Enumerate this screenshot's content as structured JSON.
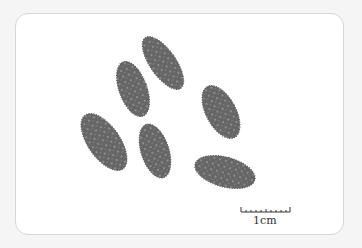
{
  "image": {
    "subject": "seeds",
    "seed_count": 6,
    "background_color": "#ffffff",
    "seed_color": "#6a6a6a",
    "scale_bar": {
      "label": "1cm",
      "ticks": 10
    }
  }
}
